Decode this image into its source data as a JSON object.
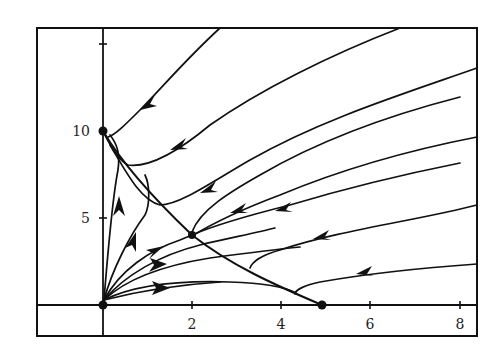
{
  "figure": {
    "title": "",
    "type": "phase-portrait",
    "x_axis": {
      "ticks": [
        {
          "value": 2,
          "label": "2"
        },
        {
          "value": 4,
          "label": "4"
        },
        {
          "value": 6,
          "label": "6"
        },
        {
          "value": 8,
          "label": "8"
        }
      ],
      "range": [
        -1.5,
        8.4
      ]
    },
    "y_axis": {
      "ticks": [
        {
          "value": 5,
          "label": "5"
        },
        {
          "value": 10,
          "label": "10"
        },
        {
          "value": 15,
          "label": ""
        }
      ],
      "range": [
        -1.8,
        16
      ]
    },
    "equilibria": [
      {
        "name": "origin",
        "x": 0,
        "y": 0
      },
      {
        "name": "y-intercept",
        "x": 0,
        "y": 10
      },
      {
        "name": "x-intercept",
        "x": 5,
        "y": 0
      },
      {
        "name": "interior",
        "x": 2,
        "y": 4
      }
    ],
    "colors": {
      "ink": "#111111",
      "background": "#ffffff"
    }
  }
}
